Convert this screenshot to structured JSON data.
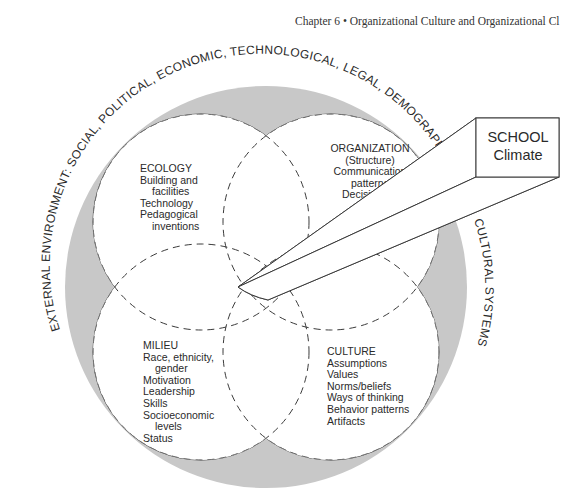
{
  "header": {
    "running_head": "Chapter 6 • Organizational Culture and Organizational Cl"
  },
  "diagram": {
    "outer_ring_text": "EXTERNAL ENVIRONMENT: SOCIAL, POLITICAL, ECONOMIC, TECHNOLOGICAL, LEGAL, DEMOGRAPHIC, ECO",
    "outer_ring_text_right": "CULTURAL SYSTEMS",
    "colors": {
      "ring_fill": "#c8c8c8",
      "stroke": "#3a3a3a",
      "text": "#2a2a2a"
    },
    "quadrants": {
      "ecology": {
        "title": "ECOLOGY",
        "items": [
          "Building and",
          "facilities",
          "Technology",
          "Pedagogical",
          "inventions"
        ]
      },
      "organization": {
        "title": "ORGANIZATION",
        "items": [
          "(Structure)",
          "Communication",
          "patterns",
          "Decision-ma",
          "patte",
          "Hier",
          "F"
        ]
      },
      "milieu": {
        "title": "MILIEU",
        "items": [
          "Race, ethnicity,",
          "gender",
          "Motivation",
          "Leadership",
          "Skills",
          "Socioeconomic",
          "levels",
          "Status"
        ]
      },
      "culture": {
        "title": "CULTURE",
        "items": [
          "Assumptions",
          "Values",
          "Norms/beliefs",
          "Ways of thinking",
          "Behavior patterns",
          "Artifacts"
        ]
      }
    },
    "beam_box": {
      "line1": "SCHOOL",
      "line2": "Climate"
    }
  }
}
